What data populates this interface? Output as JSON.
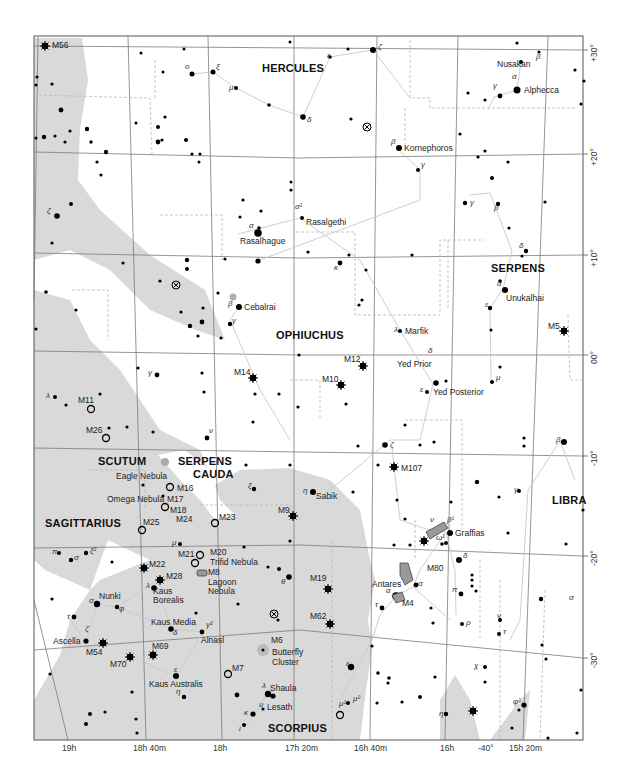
{
  "map": {
    "title": "Star chart: Ophiuchus, Serpens, Scorpius, Sagittarius region",
    "colors": {
      "milky_way": "#d9d9d9",
      "grid": "#7a7a7a",
      "star": "#000000",
      "boundary": "#b8b8b8",
      "stick": "#c8c8c8",
      "frame": "#555555"
    },
    "constellations": [
      {
        "name": "HERCULES",
        "x": 262,
        "y": 63
      },
      {
        "name": "SERPENS",
        "x": 491,
        "y": 263
      },
      {
        "name": "OPHIUCHUS",
        "x": 276,
        "y": 330
      },
      {
        "name": "SCUTUM",
        "x": 98,
        "y": 456
      },
      {
        "name": "SERPENS",
        "x": 178,
        "y": 456
      },
      {
        "name": "CAUDA",
        "x": 193,
        "y": 469
      },
      {
        "name": "LIBRA",
        "x": 552,
        "y": 495
      },
      {
        "name": "SAGITTARIUS",
        "x": 45,
        "y": 518
      },
      {
        "name": "SCORPIUS",
        "x": 268,
        "y": 723
      }
    ],
    "star_names": [
      {
        "name": "Nusakan",
        "x": 497,
        "y": 63
      },
      {
        "name": "Alphecca",
        "x": 524,
        "y": 86
      },
      {
        "name": "Kornephoros",
        "x": 404,
        "y": 145
      },
      {
        "name": "Rasalgethi",
        "x": 306,
        "y": 219
      },
      {
        "name": "Rasalhague",
        "x": 240,
        "y": 237
      },
      {
        "name": "Cebalrai",
        "x": 244,
        "y": 303
      },
      {
        "name": "Unukalhai",
        "x": 506,
        "y": 296
      },
      {
        "name": "Marfik",
        "x": 405,
        "y": 329
      },
      {
        "name": "Yed Prior",
        "x": 397,
        "y": 363
      },
      {
        "name": "Yed Posterior",
        "x": 433,
        "y": 390
      },
      {
        "name": "Sabik",
        "x": 316,
        "y": 494
      },
      {
        "name": "Graffias",
        "x": 455,
        "y": 530
      },
      {
        "name": "Antares",
        "x": 372,
        "y": 581
      },
      {
        "name": "Nunki",
        "x": 99,
        "y": 592
      },
      {
        "name": "Kaus Borealis",
        "x": 153,
        "y": 587
      },
      {
        "name": "Kaus Media",
        "x": 151,
        "y": 618
      },
      {
        "name": "Alnasl",
        "x": 201,
        "y": 637
      },
      {
        "name": "Ascella",
        "x": 53,
        "y": 637
      },
      {
        "name": "Kaus Australis",
        "x": 149,
        "y": 680
      },
      {
        "name": "Shaula",
        "x": 270,
        "y": 684
      },
      {
        "name": "Lesath",
        "x": 267,
        "y": 703
      }
    ],
    "deep_sky": [
      {
        "name": "M56",
        "x": 52,
        "y": 45,
        "type": "globular"
      },
      {
        "name": "M14",
        "x": 234,
        "y": 371,
        "type": "globular"
      },
      {
        "name": "M12",
        "x": 344,
        "y": 358,
        "type": "globular"
      },
      {
        "name": "M10",
        "x": 322,
        "y": 378,
        "type": "globular"
      },
      {
        "name": "M5",
        "x": 548,
        "y": 326,
        "type": "globular"
      },
      {
        "name": "M11",
        "x": 78,
        "y": 400,
        "type": "open"
      },
      {
        "name": "M26",
        "x": 86,
        "y": 429,
        "type": "open"
      },
      {
        "name": "M107",
        "x": 401,
        "y": 468,
        "type": "globular"
      },
      {
        "name": "Eagle Nebula",
        "x": 116,
        "y": 475,
        "type": "label"
      },
      {
        "name": "M16",
        "x": 177,
        "y": 487,
        "type": "open"
      },
      {
        "name": "Omega Nebula",
        "x": 107,
        "y": 498,
        "type": "label"
      },
      {
        "name": "M17",
        "x": 167,
        "y": 498,
        "type": "open"
      },
      {
        "name": "M18",
        "x": 170,
        "y": 510,
        "type": "open"
      },
      {
        "name": "M24",
        "x": 176,
        "y": 518,
        "type": "label"
      },
      {
        "name": "M25",
        "x": 143,
        "y": 521,
        "type": "open"
      },
      {
        "name": "M23",
        "x": 219,
        "y": 516,
        "type": "open"
      },
      {
        "name": "M9",
        "x": 278,
        "y": 509,
        "type": "globular"
      },
      {
        "name": "M21",
        "x": 178,
        "y": 553,
        "type": "open"
      },
      {
        "name": "M20",
        "x": 210,
        "y": 549,
        "type": "open"
      },
      {
        "name": "Trifid Nebula",
        "x": 210,
        "y": 560,
        "type": "label"
      },
      {
        "name": "M8",
        "x": 208,
        "y": 570,
        "type": "nebula"
      },
      {
        "name": "Lagoon",
        "x": 208,
        "y": 580,
        "type": "label"
      },
      {
        "name": "Nebula",
        "x": 208,
        "y": 589,
        "type": "label"
      },
      {
        "name": "M22",
        "x": 149,
        "y": 563,
        "type": "globular"
      },
      {
        "name": "M28",
        "x": 166,
        "y": 574,
        "type": "globular"
      },
      {
        "name": "M80",
        "x": 427,
        "y": 566,
        "type": "globular"
      },
      {
        "name": "M19",
        "x": 310,
        "y": 578,
        "type": "globular"
      },
      {
        "name": "M4",
        "x": 402,
        "y": 601,
        "type": "globular"
      },
      {
        "name": "M62",
        "x": 310,
        "y": 616,
        "type": "globular"
      },
      {
        "name": "M6",
        "x": 271,
        "y": 638,
        "type": "label"
      },
      {
        "name": "Butterfly",
        "x": 272,
        "y": 650,
        "type": "label"
      },
      {
        "name": "Cluster",
        "x": 272,
        "y": 660,
        "type": "label"
      },
      {
        "name": "M54",
        "x": 86,
        "y": 647,
        "type": "globular"
      },
      {
        "name": "M69",
        "x": 152,
        "y": 643,
        "type": "globular"
      },
      {
        "name": "M70",
        "x": 110,
        "y": 660,
        "type": "globular"
      },
      {
        "name": "M7",
        "x": 232,
        "y": 667,
        "type": "open"
      }
    ],
    "greek_labels": [
      {
        "t": "ο",
        "x": 185,
        "y": 68
      },
      {
        "t": "ξ",
        "x": 216,
        "y": 68
      },
      {
        "t": "μ",
        "x": 229,
        "y": 89
      },
      {
        "t": "δ",
        "x": 307,
        "y": 121
      },
      {
        "t": "ε",
        "x": 327,
        "y": 57
      },
      {
        "t": "ζ",
        "x": 378,
        "y": 48
      },
      {
        "t": "β",
        "x": 536,
        "y": 58
      },
      {
        "t": "α",
        "x": 512,
        "y": 78
      },
      {
        "t": "γ",
        "x": 493,
        "y": 87
      },
      {
        "t": "β",
        "x": 391,
        "y": 143
      },
      {
        "t": "γ",
        "x": 421,
        "y": 166
      },
      {
        "t": "ζ",
        "x": 47,
        "y": 212
      },
      {
        "t": "α¹",
        "x": 295,
        "y": 208
      },
      {
        "t": "α",
        "x": 249,
        "y": 227
      },
      {
        "t": "κ",
        "x": 334,
        "y": 269
      },
      {
        "t": "γ",
        "x": 470,
        "y": 204
      },
      {
        "t": "β",
        "x": 494,
        "y": 209
      },
      {
        "t": "δ",
        "x": 519,
        "y": 247
      },
      {
        "t": "α",
        "x": 497,
        "y": 285
      },
      {
        "t": "ε",
        "x": 485,
        "y": 306
      },
      {
        "t": "β",
        "x": 228,
        "y": 305
      },
      {
        "t": "γ",
        "x": 232,
        "y": 322
      },
      {
        "t": "λ",
        "x": 394,
        "y": 331
      },
      {
        "t": "γ",
        "x": 148,
        "y": 374
      },
      {
        "t": "δ",
        "x": 428,
        "y": 352
      },
      {
        "t": "ε",
        "x": 420,
        "y": 391
      },
      {
        "t": "μ",
        "x": 496,
        "y": 379
      },
      {
        "t": "λ",
        "x": 46,
        "y": 397
      },
      {
        "t": "ν",
        "x": 209,
        "y": 432
      },
      {
        "t": "ζ",
        "x": 390,
        "y": 446
      },
      {
        "t": "β",
        "x": 556,
        "y": 441
      },
      {
        "t": "ξ",
        "x": 248,
        "y": 487
      },
      {
        "t": "η",
        "x": 303,
        "y": 492
      },
      {
        "t": "γ",
        "x": 514,
        "y": 491
      },
      {
        "t": "ν",
        "x": 430,
        "y": 521
      },
      {
        "t": "β¹",
        "x": 447,
        "y": 521
      },
      {
        "t": "ω¹",
        "x": 436,
        "y": 539
      },
      {
        "t": "δ",
        "x": 463,
        "y": 557
      },
      {
        "t": "π",
        "x": 52,
        "y": 553
      },
      {
        "t": "ξ²",
        "x": 90,
        "y": 552
      },
      {
        "t": "σ",
        "x": 74,
        "y": 559
      },
      {
        "t": "μ",
        "x": 172,
        "y": 544
      },
      {
        "t": "θ",
        "x": 281,
        "y": 583
      },
      {
        "t": "λ",
        "x": 146,
        "y": 587
      },
      {
        "t": "σ",
        "x": 89,
        "y": 602
      },
      {
        "t": "φ",
        "x": 119,
        "y": 610
      },
      {
        "t": "τ",
        "x": 67,
        "y": 618
      },
      {
        "t": "ζ",
        "x": 85,
        "y": 630
      },
      {
        "t": "σ",
        "x": 418,
        "y": 585
      },
      {
        "t": "α",
        "x": 386,
        "y": 592
      },
      {
        "t": "τ",
        "x": 375,
        "y": 606
      },
      {
        "t": "π",
        "x": 452,
        "y": 591
      },
      {
        "t": "ν",
        "x": 497,
        "y": 617
      },
      {
        "t": "ρ",
        "x": 466,
        "y": 624
      },
      {
        "t": "τ",
        "x": 503,
        "y": 633
      },
      {
        "t": "σ",
        "x": 569,
        "y": 599
      },
      {
        "t": "γ²",
        "x": 206,
        "y": 626
      },
      {
        "t": "δ",
        "x": 173,
        "y": 634
      },
      {
        "t": "ε",
        "x": 174,
        "y": 671
      },
      {
        "t": "η",
        "x": 176,
        "y": 693
      },
      {
        "t": "ε",
        "x": 346,
        "y": 665
      },
      {
        "t": "λ",
        "x": 262,
        "y": 687
      },
      {
        "t": "υ",
        "x": 259,
        "y": 706
      },
      {
        "t": "κ",
        "x": 244,
        "y": 714
      },
      {
        "t": "ι",
        "x": 239,
        "y": 730
      },
      {
        "t": "μ¹",
        "x": 339,
        "y": 705
      },
      {
        "t": "μ²",
        "x": 353,
        "y": 700
      },
      {
        "t": "χ",
        "x": 474,
        "y": 667
      },
      {
        "t": "η",
        "x": 439,
        "y": 715
      },
      {
        "t": "φ¹",
        "x": 513,
        "y": 703
      }
    ],
    "ra_axis": [
      {
        "label": "19h",
        "x": 62
      },
      {
        "label": "18h 40m",
        "x": 133
      },
      {
        "label": "18h",
        "x": 213
      },
      {
        "label": "17h 20m",
        "x": 292
      },
      {
        "label": "16h 40m",
        "x": 358
      },
      {
        "label": "16h",
        "x": 438
      },
      {
        "label": "-40°",
        "x": 468
      },
      {
        "label": "15h 20m",
        "x": 508
      }
    ],
    "dec_axis": [
      {
        "label": "+30°",
        "y": 53
      },
      {
        "label": "+20°",
        "y": 160
      },
      {
        "label": "+10°",
        "y": 263
      },
      {
        "label": "00°",
        "y": 360
      },
      {
        "label": "-10°",
        "y": 458
      },
      {
        "label": "-20°",
        "y": 555
      },
      {
        "label": "-30°",
        "y": 656
      }
    ]
  }
}
